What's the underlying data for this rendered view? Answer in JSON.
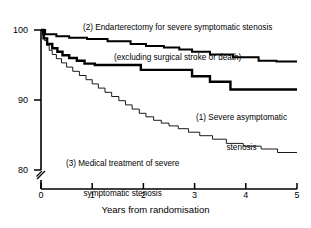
{
  "chart_data": {
    "type": "line",
    "subtype": "kaplan-meier-step",
    "title": "",
    "xlabel": "Years from randomisation",
    "ylabel": "",
    "xlim": [
      0,
      5
    ],
    "ylim": [
      80,
      100
    ],
    "y_axis_break": true,
    "y_axis_break_symbol": "//",
    "grid": false,
    "legend_position": "inline-annotations",
    "xticks": [
      "0",
      "1",
      "2",
      "3",
      "4",
      "5"
    ],
    "xtick_values": [
      0,
      1,
      2,
      3,
      4,
      5
    ],
    "yticks": [
      "100",
      "90",
      "80"
    ],
    "ytick_values": [
      100,
      90,
      80
    ],
    "series": [
      {
        "name": "(2) Endarterectomy for severe symptomatic stenosis (excluding surgical stroke or death)",
        "key": "endarterectomy",
        "linewidth": 2.0,
        "final_value": 95.5,
        "points": [
          [
            0.0,
            100.0
          ],
          [
            0.08,
            100.0
          ],
          [
            0.08,
            99.4
          ],
          [
            0.3,
            99.4
          ],
          [
            0.3,
            99.1
          ],
          [
            0.55,
            99.1
          ],
          [
            0.55,
            98.9
          ],
          [
            0.9,
            98.9
          ],
          [
            0.9,
            98.7
          ],
          [
            1.3,
            98.7
          ],
          [
            1.3,
            98.4
          ],
          [
            1.75,
            98.4
          ],
          [
            1.75,
            98.0
          ],
          [
            2.05,
            98.0
          ],
          [
            2.05,
            97.7
          ],
          [
            2.4,
            97.7
          ],
          [
            2.4,
            97.5
          ],
          [
            2.7,
            97.5
          ],
          [
            2.7,
            97.2
          ],
          [
            2.95,
            97.2
          ],
          [
            2.95,
            96.9
          ],
          [
            3.3,
            96.9
          ],
          [
            3.3,
            96.5
          ],
          [
            3.75,
            96.5
          ],
          [
            3.75,
            96.1
          ],
          [
            4.25,
            96.1
          ],
          [
            4.25,
            95.6
          ],
          [
            4.6,
            95.6
          ],
          [
            4.6,
            95.5
          ],
          [
            5.0,
            95.5
          ]
        ]
      },
      {
        "name": "(1) Severe asymptomatic stenosis",
        "key": "asymptomatic",
        "linewidth": 2.4,
        "final_value": 91.5,
        "points": [
          [
            0.0,
            100.0
          ],
          [
            0.05,
            100.0
          ],
          [
            0.05,
            98.8
          ],
          [
            0.12,
            98.8
          ],
          [
            0.12,
            98.0
          ],
          [
            0.22,
            98.0
          ],
          [
            0.22,
            97.4
          ],
          [
            0.32,
            97.4
          ],
          [
            0.32,
            96.9
          ],
          [
            0.42,
            96.9
          ],
          [
            0.42,
            96.4
          ],
          [
            0.55,
            96.4
          ],
          [
            0.55,
            96.0
          ],
          [
            0.7,
            96.0
          ],
          [
            0.7,
            95.6
          ],
          [
            0.85,
            95.6
          ],
          [
            0.85,
            95.2
          ],
          [
            1.05,
            95.2
          ],
          [
            1.05,
            95.0
          ],
          [
            1.95,
            95.0
          ],
          [
            1.95,
            94.3
          ],
          [
            2.95,
            94.3
          ],
          [
            2.95,
            93.4
          ],
          [
            3.3,
            93.4
          ],
          [
            3.3,
            92.6
          ],
          [
            3.7,
            92.6
          ],
          [
            3.7,
            91.5
          ],
          [
            5.0,
            91.5
          ]
        ]
      },
      {
        "name": "(3) Medical treatment of severe symptomatic stenosis",
        "key": "medical",
        "linewidth": 0.9,
        "final_value": 82.5,
        "points": [
          [
            0.0,
            100.0
          ],
          [
            0.03,
            100.0
          ],
          [
            0.03,
            99.3
          ],
          [
            0.07,
            99.3
          ],
          [
            0.07,
            98.5
          ],
          [
            0.11,
            98.5
          ],
          [
            0.11,
            97.8
          ],
          [
            0.16,
            97.8
          ],
          [
            0.16,
            97.1
          ],
          [
            0.22,
            97.1
          ],
          [
            0.22,
            96.5
          ],
          [
            0.3,
            96.5
          ],
          [
            0.3,
            95.9
          ],
          [
            0.4,
            95.9
          ],
          [
            0.4,
            95.3
          ],
          [
            0.5,
            95.3
          ],
          [
            0.5,
            94.7
          ],
          [
            0.62,
            94.7
          ],
          [
            0.62,
            94.1
          ],
          [
            0.75,
            94.1
          ],
          [
            0.75,
            93.5
          ],
          [
            0.88,
            93.5
          ],
          [
            0.88,
            92.9
          ],
          [
            1.0,
            92.9
          ],
          [
            1.0,
            92.3
          ],
          [
            1.12,
            92.3
          ],
          [
            1.12,
            91.7
          ],
          [
            1.25,
            91.7
          ],
          [
            1.25,
            91.1
          ],
          [
            1.38,
            91.1
          ],
          [
            1.38,
            90.5
          ],
          [
            1.52,
            90.5
          ],
          [
            1.52,
            89.9
          ],
          [
            1.65,
            89.9
          ],
          [
            1.65,
            89.3
          ],
          [
            1.78,
            89.3
          ],
          [
            1.78,
            88.7
          ],
          [
            1.92,
            88.7
          ],
          [
            1.92,
            88.1
          ],
          [
            2.05,
            88.1
          ],
          [
            2.05,
            87.6
          ],
          [
            2.2,
            87.6
          ],
          [
            2.2,
            87.1
          ],
          [
            2.35,
            87.1
          ],
          [
            2.35,
            86.7
          ],
          [
            2.5,
            86.7
          ],
          [
            2.5,
            86.3
          ],
          [
            2.68,
            86.3
          ],
          [
            2.68,
            85.9
          ],
          [
            2.88,
            85.9
          ],
          [
            2.88,
            85.4
          ],
          [
            3.1,
            85.4
          ],
          [
            3.1,
            84.9
          ],
          [
            3.35,
            84.9
          ],
          [
            3.35,
            84.4
          ],
          [
            3.62,
            84.4
          ],
          [
            3.62,
            83.8
          ],
          [
            3.95,
            83.8
          ],
          [
            3.95,
            83.4
          ],
          [
            4.3,
            83.4
          ],
          [
            4.3,
            83.0
          ],
          [
            4.62,
            83.0
          ],
          [
            4.62,
            82.5
          ],
          [
            5.0,
            82.5
          ]
        ]
      }
    ],
    "annotations": [
      {
        "id": "ann-2",
        "line1": "(2) Endarterectomy for severe symptomatic stenosis",
        "line2": "(excluding surgical stroke or death)"
      },
      {
        "id": "ann-1",
        "line1": "(1) Severe asymptomatic",
        "line2": "stenosis"
      },
      {
        "id": "ann-3",
        "line1": "(3) Medical treatment of severe",
        "line2": "symptomatic stenosis"
      }
    ],
    "colors": {
      "line": "#000000",
      "axis": "#000000",
      "background": "#ffffff",
      "text": "#000000"
    }
  }
}
